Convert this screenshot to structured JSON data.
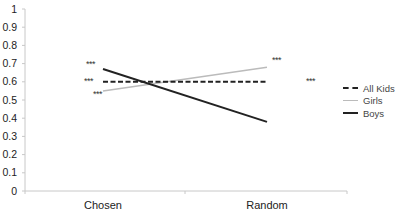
{
  "chart_data": {
    "type": "line",
    "title": "",
    "xlabel": "",
    "ylabel": "",
    "categories": [
      "Chosen",
      "Random"
    ],
    "ylim": [
      0,
      1
    ],
    "yticks": [
      "0",
      "0.1",
      "0.2",
      "0.3",
      "0.4",
      "0.5",
      "0.6",
      "0.7",
      "0.8",
      "0.9",
      "1"
    ],
    "grid": false,
    "legend_position": "right",
    "series": [
      {
        "name": "All Kids",
        "values": [
          0.6,
          0.6
        ],
        "color": "#222222",
        "style": "dashed",
        "annotations": [
          "***",
          "***"
        ]
      },
      {
        "name": "Girls",
        "values": [
          0.55,
          0.68
        ],
        "color": "#bbbbbb",
        "style": "solid",
        "annotations": [
          "***",
          "***"
        ]
      },
      {
        "name": "Boys",
        "values": [
          0.67,
          0.38
        ],
        "color": "#222222",
        "style": "solid",
        "annotations": [
          "***",
          ""
        ]
      }
    ]
  },
  "legend": {
    "items": [
      {
        "label": "All Kids"
      },
      {
        "label": "Girls"
      },
      {
        "label": "Boys"
      }
    ]
  }
}
